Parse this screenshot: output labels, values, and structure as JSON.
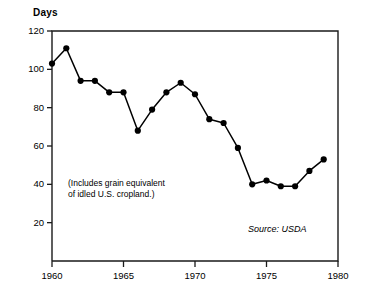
{
  "chart_data": {
    "type": "line",
    "title": "",
    "ylabel": "Days",
    "xlabel": "",
    "ylim": [
      0,
      120
    ],
    "xlim": [
      1960,
      1980
    ],
    "yticks": [
      20,
      40,
      60,
      80,
      100,
      120
    ],
    "xticks": [
      1960,
      1965,
      1970,
      1975,
      1980
    ],
    "ytick_labels": [
      "20",
      "40",
      "60",
      "80",
      "100",
      "120"
    ],
    "xtick_labels": [
      "1960",
      "1965",
      "1970",
      "1975",
      "1980"
    ],
    "grid": false,
    "legend": false,
    "marker": "filled-circle",
    "line_color": "#000000",
    "marker_color": "#000000",
    "x": [
      1960,
      1961,
      1962,
      1963,
      1964,
      1965,
      1966,
      1967,
      1968,
      1969,
      1970,
      1971,
      1972,
      1973,
      1974,
      1975,
      1976,
      1977,
      1978
    ],
    "values": [
      103,
      111,
      94,
      94,
      88,
      88,
      68,
      79,
      88,
      93,
      87,
      74,
      72,
      59,
      40,
      42,
      39,
      39,
      47
    ],
    "series": [
      {
        "name": "Days of grain supply",
        "values": [
          103,
          111,
          94,
          94,
          88,
          88,
          68,
          79,
          88,
          93,
          87,
          74,
          72,
          59,
          40,
          42,
          39,
          39,
          47
        ]
      }
    ],
    "annotations": [
      {
        "name": "includes-note",
        "line1": "(Includes grain equivalent",
        "line2": "of idled U.S. cropland.)"
      },
      {
        "name": "source-note",
        "text": "Source: USDA"
      }
    ],
    "last_point_extra": 53
  },
  "axis": {
    "y_title": "Days"
  },
  "notes": {
    "line1": "(Includes grain equivalent",
    "line2": "of idled U.S. cropland.)",
    "source": "Source: USDA"
  }
}
